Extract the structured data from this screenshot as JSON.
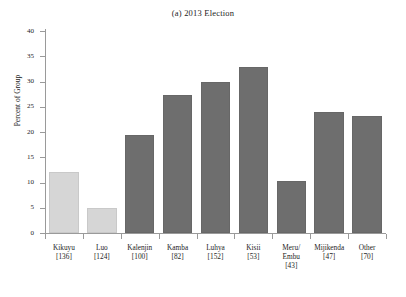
{
  "chart_data": {
    "type": "bar",
    "title": "(a) 2013 Election",
    "xlabel": "",
    "ylabel": "Percent of Group",
    "ylim": [
      0,
      40
    ],
    "ytick_labels": [
      "0",
      "5",
      "10",
      "15",
      "20",
      "25",
      "30",
      "35",
      "40"
    ],
    "ytick_values": [
      0,
      5,
      10,
      15,
      20,
      25,
      30,
      35,
      40
    ],
    "grid": false,
    "legend": "none",
    "categories": [
      "Kikuyu",
      "Luo",
      "Kalenjin",
      "Kamba",
      "Luhya",
      "Kisii",
      "Meru/\nEmbu",
      "Mijikenda",
      "Other"
    ],
    "category_counts": [
      "[136]",
      "[124]",
      "[100]",
      "[82]",
      "[152]",
      "[53]",
      "[43]",
      "[47]",
      "[70]"
    ],
    "values": [
      12.1,
      4.95,
      19.5,
      27.3,
      29.9,
      32.8,
      10.3,
      23.9,
      23.2
    ],
    "bar_colors": [
      "#d6d6d6",
      "#d6d6d6",
      "#6e6e6e",
      "#6e6e6e",
      "#6e6e6e",
      "#6e6e6e",
      "#6e6e6e",
      "#6e6e6e",
      "#6e6e6e"
    ],
    "bars": [
      {
        "label": "Kikuyu",
        "count": "[136]",
        "value": 12.1,
        "color": "#d6d6d6"
      },
      {
        "label": "Luo",
        "count": "[124]",
        "value": 4.95,
        "color": "#d6d6d6"
      },
      {
        "label": "Kalenjin",
        "count": "[100]",
        "value": 19.5,
        "color": "#6e6e6e"
      },
      {
        "label": "Kamba",
        "count": "[82]",
        "value": 27.3,
        "color": "#6e6e6e"
      },
      {
        "label": "Luhya",
        "count": "[152]",
        "value": 29.9,
        "color": "#6e6e6e"
      },
      {
        "label": "Kisii",
        "count": "[53]",
        "value": 32.8,
        "color": "#6e6e6e"
      },
      {
        "label": "Meru/",
        "label2": "Embu",
        "count": "[43]",
        "value": 10.3,
        "color": "#6e6e6e"
      },
      {
        "label": "Mijikenda",
        "count": "[47]",
        "value": 23.9,
        "color": "#6e6e6e"
      },
      {
        "label": "Other",
        "count": "[70]",
        "value": 23.2,
        "color": "#6e6e6e"
      }
    ]
  },
  "colors": {
    "axis": "#9a9a9a",
    "text": "#1d1d1d",
    "bar_light": "#d6d6d6",
    "bar_dark": "#6e6e6e",
    "background": "#ffffff"
  }
}
